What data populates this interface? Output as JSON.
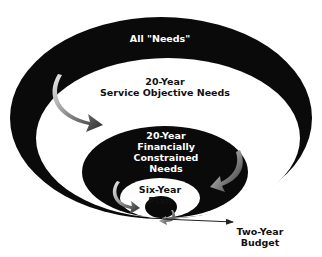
{
  "diagram": {
    "levels": [
      {
        "id": "all-needs",
        "label": "All \"Needs\""
      },
      {
        "id": "service-objective",
        "label_line1": "20-Year",
        "label_line2": "Service Objective Needs"
      },
      {
        "id": "financially-constrained",
        "label_line1": "20-Year",
        "label_line2": "Financially",
        "label_line3": "Constrained",
        "label_line4": "Needs"
      },
      {
        "id": "six-year-plan",
        "label_line1": "Six-Year",
        "label_line2": "Plan"
      },
      {
        "id": "two-year-budget",
        "label_line1": "Two-Year",
        "label_line2": "Budget"
      }
    ],
    "colors": {
      "ring_dark": "#0a0a0a",
      "ring_light": "#ffffff",
      "arrow_gradient_start": "#e8e8e8",
      "arrow_gradient_end": "#3a3a3a"
    }
  }
}
